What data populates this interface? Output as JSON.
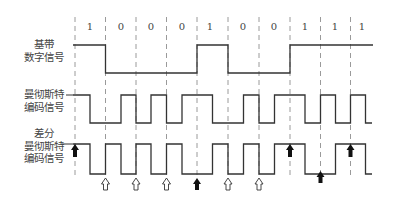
{
  "bits": [
    "1",
    "0",
    "0",
    "0",
    "1",
    "0",
    "0",
    "1",
    "1",
    "1"
  ],
  "rows": [
    {
      "id": "baseband",
      "label_lines": [
        "基带",
        "数字信号"
      ]
    },
    {
      "id": "manchester",
      "label_lines": [
        "曼彻斯特",
        "编码信号"
      ]
    },
    {
      "id": "diff_manchester",
      "label_lines": [
        "差分",
        "曼彻斯特",
        "编码信号"
      ]
    }
  ],
  "legend": {
    "filled_arrow": "bit 1: no transition at bit start",
    "hollow_arrow": "bit 0: transition at bit start"
  },
  "colors": {
    "signal": "#333333",
    "dash": "#999999",
    "text": "#444444"
  }
}
